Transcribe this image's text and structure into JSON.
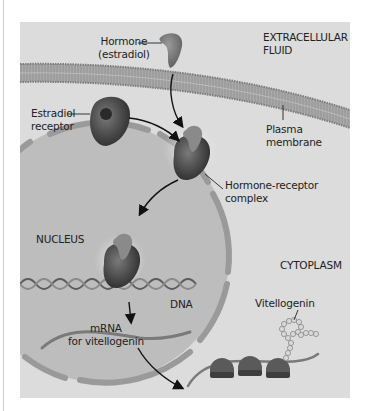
{
  "figure": {
    "colors": {
      "background": "#ffffff",
      "panel": "#dcdcdc",
      "membrane": "#a8a8a8",
      "nucleus": "#b9b9b9",
      "protein_dark": "#4a4a4a",
      "text": "#222222"
    },
    "labels": {
      "hormone_line1": "Hormone",
      "hormone_line2": "(estradiol)",
      "extracellular_line1": "EXTRACELLULAR",
      "extracellular_line2": "FLUID",
      "receptor_line1": "Estradiol",
      "receptor_line2": "receptor",
      "plasma_line1": "Plasma",
      "plasma_line2": "membrane",
      "complex_line1": "Hormone-receptor",
      "complex_line2": "complex",
      "nucleus": "NUCLEUS",
      "cytoplasm": "CYTOPLASM",
      "dna": "DNA",
      "mrna_line1": "mRNA",
      "mrna_line2": "for vitellogenin",
      "vitellogenin": "Vitellogenin"
    }
  }
}
